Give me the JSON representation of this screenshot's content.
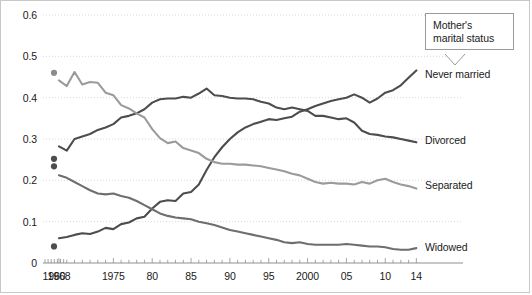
{
  "callout": {
    "line1": "Mother's",
    "line2": "marital status"
  },
  "axis": {
    "y_ticks": [
      "0.6",
      "0.5",
      "0.4",
      "0.3",
      "0.2",
      "0.1",
      "0"
    ],
    "x_ticks": [
      "1960",
      "1968",
      "1975",
      "80",
      "85",
      "90",
      "95",
      "2000",
      "05",
      "10",
      "14"
    ]
  },
  "series_labels": {
    "never_married": "Never married",
    "divorced": "Divorced",
    "separated": "Separated",
    "widowed": "Widowed"
  },
  "chart_data": {
    "type": "line",
    "title": "Mother's marital status",
    "xlabel": "",
    "ylabel": "",
    "xlim": [
      1960,
      2014
    ],
    "ylim": [
      0,
      0.6
    ],
    "grid": true,
    "legend_position": "right-inline",
    "ytick_values": [
      0,
      0.1,
      0.2,
      0.3,
      0.4,
      0.5,
      0.6
    ],
    "ytick_labels": [
      "0",
      "0.1",
      "0.2",
      "0.3",
      "0.4",
      "0.5",
      "0.6"
    ],
    "xtick_values": [
      1960,
      1968,
      1975,
      1980,
      1985,
      1990,
      1995,
      2000,
      2005,
      2010,
      2014
    ],
    "xtick_labels": [
      "1960",
      "1968",
      "1975",
      "80",
      "85",
      "90",
      "95",
      "2000",
      "05",
      "10",
      "14"
    ],
    "annotations": [
      {
        "text": "Mother's marital status",
        "type": "callout-box",
        "x": 2008,
        "y": 0.56
      }
    ],
    "isolated_points": {
      "note": "single 1960 observations plotted as dots, disconnected from the 1968+ series",
      "x": 1960,
      "points": [
        {
          "series": "Separated",
          "y": 0.46,
          "color": "#8c8c8c"
        },
        {
          "series": "Divorced",
          "y": 0.252,
          "color": "#4d4d4d"
        },
        {
          "series": "Widowed2",
          "y": 0.234,
          "color": "#4d4d4d"
        },
        {
          "series": "Never married",
          "y": 0.04,
          "color": "#4d4d4d"
        }
      ]
    },
    "series": [
      {
        "name": "Never married",
        "color": "#4d4d4d",
        "label_y": 0.455,
        "x": [
          1968,
          1969,
          1970,
          1971,
          1972,
          1973,
          1974,
          1975,
          1976,
          1977,
          1978,
          1979,
          1980,
          1981,
          1982,
          1983,
          1984,
          1985,
          1986,
          1987,
          1988,
          1989,
          1990,
          1991,
          1992,
          1993,
          1994,
          1995,
          1996,
          1997,
          1998,
          1999,
          2000,
          2001,
          2002,
          2003,
          2004,
          2005,
          2006,
          2007,
          2008,
          2009,
          2010,
          2011,
          2012,
          2013,
          2014
        ],
        "values": [
          0.06,
          0.063,
          0.068,
          0.072,
          0.07,
          0.076,
          0.085,
          0.082,
          0.094,
          0.098,
          0.108,
          0.112,
          0.132,
          0.148,
          0.152,
          0.15,
          0.168,
          0.172,
          0.19,
          0.225,
          0.256,
          0.28,
          0.3,
          0.316,
          0.328,
          0.336,
          0.342,
          0.348,
          0.346,
          0.35,
          0.354,
          0.366,
          0.372,
          0.38,
          0.386,
          0.392,
          0.396,
          0.4,
          0.408,
          0.4,
          0.388,
          0.398,
          0.412,
          0.418,
          0.43,
          0.448,
          0.466
        ]
      },
      {
        "name": "Divorced",
        "color": "#4d4d4d",
        "label_y": 0.296,
        "x": [
          1968,
          1969,
          1970,
          1971,
          1972,
          1973,
          1974,
          1975,
          1976,
          1977,
          1978,
          1979,
          1980,
          1981,
          1982,
          1983,
          1984,
          1985,
          1986,
          1987,
          1988,
          1989,
          1990,
          1991,
          1992,
          1993,
          1994,
          1995,
          1996,
          1997,
          1998,
          1999,
          2000,
          2001,
          2002,
          2003,
          2004,
          2005,
          2006,
          2007,
          2008,
          2009,
          2010,
          2011,
          2012,
          2013,
          2014
        ],
        "values": [
          0.282,
          0.272,
          0.3,
          0.306,
          0.312,
          0.322,
          0.328,
          0.336,
          0.352,
          0.356,
          0.362,
          0.372,
          0.388,
          0.396,
          0.398,
          0.398,
          0.402,
          0.4,
          0.41,
          0.422,
          0.406,
          0.404,
          0.4,
          0.398,
          0.398,
          0.396,
          0.39,
          0.386,
          0.376,
          0.372,
          0.376,
          0.372,
          0.368,
          0.356,
          0.356,
          0.352,
          0.348,
          0.35,
          0.34,
          0.32,
          0.312,
          0.31,
          0.306,
          0.304,
          0.3,
          0.296,
          0.292
        ]
      },
      {
        "name": "Separated",
        "color": "#9b9b9b",
        "label_y": 0.186,
        "x": [
          1968,
          1969,
          1970,
          1971,
          1972,
          1973,
          1974,
          1975,
          1976,
          1977,
          1978,
          1979,
          1980,
          1981,
          1982,
          1983,
          1984,
          1985,
          1986,
          1987,
          1988,
          1989,
          1990,
          1991,
          1992,
          1993,
          1994,
          1995,
          1996,
          1997,
          1998,
          1999,
          2000,
          2001,
          2002,
          2003,
          2004,
          2005,
          2006,
          2007,
          2008,
          2009,
          2010,
          2011,
          2012,
          2013,
          2014
        ],
        "values": [
          0.442,
          0.428,
          0.462,
          0.432,
          0.438,
          0.436,
          0.412,
          0.406,
          0.382,
          0.374,
          0.362,
          0.352,
          0.324,
          0.302,
          0.29,
          0.294,
          0.278,
          0.272,
          0.266,
          0.252,
          0.244,
          0.24,
          0.24,
          0.238,
          0.238,
          0.236,
          0.234,
          0.23,
          0.226,
          0.222,
          0.216,
          0.212,
          0.204,
          0.196,
          0.192,
          0.194,
          0.192,
          0.192,
          0.19,
          0.196,
          0.192,
          0.2,
          0.204,
          0.196,
          0.19,
          0.186,
          0.18
        ]
      },
      {
        "name": "Widowed",
        "color": "#6e6e6e",
        "label_y": 0.036,
        "x": [
          1968,
          1969,
          1970,
          1971,
          1972,
          1973,
          1974,
          1975,
          1976,
          1977,
          1978,
          1979,
          1980,
          1981,
          1982,
          1983,
          1984,
          1985,
          1986,
          1987,
          1988,
          1989,
          1990,
          1991,
          1992,
          1993,
          1994,
          1995,
          1996,
          1997,
          1998,
          1999,
          2000,
          2001,
          2002,
          2003,
          2004,
          2005,
          2006,
          2007,
          2008,
          2009,
          2010,
          2011,
          2012,
          2013,
          2014
        ],
        "values": [
          0.212,
          0.206,
          0.196,
          0.186,
          0.176,
          0.168,
          0.166,
          0.168,
          0.162,
          0.158,
          0.15,
          0.14,
          0.13,
          0.12,
          0.114,
          0.11,
          0.108,
          0.106,
          0.1,
          0.096,
          0.092,
          0.086,
          0.08,
          0.076,
          0.072,
          0.068,
          0.064,
          0.06,
          0.056,
          0.05,
          0.048,
          0.05,
          0.046,
          0.044,
          0.044,
          0.044,
          0.044,
          0.046,
          0.044,
          0.042,
          0.04,
          0.04,
          0.038,
          0.034,
          0.032,
          0.032,
          0.036
        ]
      }
    ]
  }
}
